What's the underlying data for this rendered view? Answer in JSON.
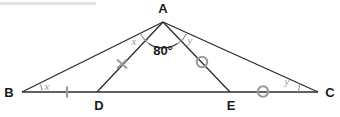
{
  "figure": {
    "background_color": "#ffffff",
    "line_color": "#2b2b2b",
    "mark_color": "#9a9a9a",
    "label_color": "#1a1a1a"
  },
  "points": {
    "A": {
      "label": "A",
      "x": 163,
      "y": 22,
      "label_x": 163,
      "label_y": 13
    },
    "B": {
      "label": "B",
      "x": 22,
      "y": 92,
      "label_x": 9,
      "label_y": 97
    },
    "C": {
      "label": "C",
      "x": 318,
      "y": 92,
      "label_x": 329,
      "label_y": 97
    },
    "D": {
      "label": "D",
      "x": 97,
      "y": 92,
      "label_x": 99,
      "label_y": 108
    },
    "E": {
      "label": "E",
      "x": 230,
      "y": 92,
      "label_x": 231,
      "label_y": 108
    }
  },
  "segments": [
    {
      "name": "segment-BA",
      "from": "B",
      "to": "A"
    },
    {
      "name": "segment-AC",
      "from": "A",
      "to": "C"
    },
    {
      "name": "segment-BC",
      "from": "B",
      "to": "C"
    },
    {
      "name": "segment-AD",
      "from": "A",
      "to": "D"
    },
    {
      "name": "segment-AE",
      "from": "A",
      "to": "E"
    }
  ],
  "angles": {
    "at_B": {
      "label": "x",
      "label_x": 47,
      "label_y": 88
    },
    "at_BAD": {
      "label": "x",
      "label_x": 133,
      "label_y": 43
    },
    "at_DAE": {
      "label": "80°",
      "label_x": 163,
      "label_y": 50
    },
    "at_EAC": {
      "label": "y",
      "label_x": 190,
      "label_y": 42
    },
    "at_C": {
      "label": "y",
      "label_x": 285,
      "label_y": 84
    }
  },
  "tick_marks": [
    {
      "name": "tick-BD-dash",
      "type": "dash",
      "x": 67,
      "y": 92
    },
    {
      "name": "tick-AD-cross",
      "type": "cross",
      "x": 122,
      "y": 64
    },
    {
      "name": "tick-AE-circle",
      "type": "circle",
      "x": 202,
      "y": 62
    },
    {
      "name": "tick-EC-circle",
      "type": "circle",
      "x": 263,
      "y": 92
    }
  ]
}
